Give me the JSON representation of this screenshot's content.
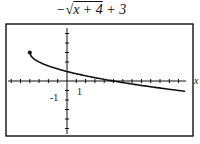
{
  "chart_data": {
    "type": "line",
    "function": "-sqrt(x+4)+3",
    "xlabel": "x",
    "ylabel": "",
    "tick_labels": {
      "x": [
        "1"
      ],
      "y": [
        "-1"
      ]
    },
    "xlim": [
      -6.3,
      13.5
    ],
    "ylim": [
      -6,
      6
    ],
    "domain_start": {
      "x": -4,
      "y": 3,
      "marker": "closed-dot"
    },
    "points": [
      {
        "x": -4,
        "y": 3
      },
      {
        "x": -3,
        "y": 2
      },
      {
        "x": 0,
        "y": 1
      },
      {
        "x": 5,
        "y": 0
      },
      {
        "x": 12,
        "y": -1
      },
      {
        "x": 12.7,
        "y": -1.09
      }
    ],
    "grid": false,
    "legend": null
  },
  "title_parts": {
    "minus": "−",
    "radicand": "x + 4",
    "tail": " + 3"
  }
}
